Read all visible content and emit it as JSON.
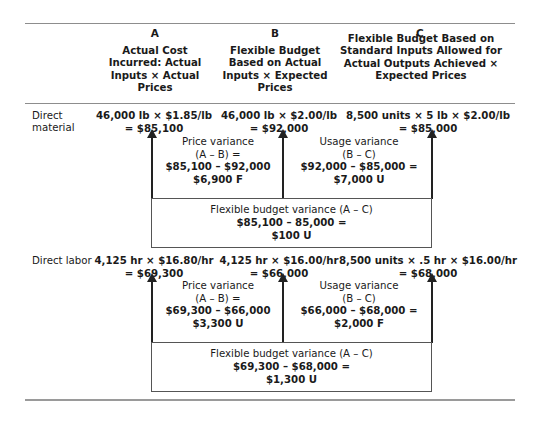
{
  "columns": {
    "a": {
      "letter": "A",
      "heading": "Actual Cost Incurred: Actual Inputs × Actual Prices"
    },
    "b": {
      "letter": "B",
      "heading": "Flexible Budget Based on Actual Inputs × Expected Prices"
    },
    "c": {
      "letter": "C",
      "heading": "Flexible Budget Based on Standard Inputs Allowed for Actual Outputs Achieved × Expected Prices"
    }
  },
  "rows": [
    {
      "label": "Direct material",
      "cells": {
        "a": {
          "line1": "46,000 lb × $1.85/lb",
          "line2": "= $85,100"
        },
        "b": {
          "line1": "46,000 lb × $2.00/lb",
          "line2": "= $92,000"
        },
        "c": {
          "line1": "8,500 units × 5 lb × $2.00/lb",
          "line2": "= $85,000"
        }
      },
      "price_variance": {
        "title": "Price variance",
        "formula": "(A – B) =",
        "calc": "$85,100 – $92,000",
        "result": "$6,900 F"
      },
      "usage_variance": {
        "title": "Usage variance",
        "formula": "(B – C)",
        "calc": "$92,000 – $85,000 =",
        "result": "$7,000 U"
      },
      "flexible_budget_variance": {
        "title": "Flexible budget variance (A – C)",
        "calc": "$85,100 – 85,000 =",
        "result": "$100 U"
      }
    },
    {
      "label": "Direct labor",
      "cells": {
        "a": {
          "line1": "4,125 hr × $16.80/hr",
          "line2": "= $69,300"
        },
        "b": {
          "line1": "4,125 hr × $16.00/hr",
          "line2": "= $66,000"
        },
        "c": {
          "line1": "8,500 units × .5 hr × $16.00/hr",
          "line2": "= $68,000"
        }
      },
      "price_variance": {
        "title": "Price variance",
        "formula": "(A – B) =",
        "calc": "$69,300 – $66,000",
        "result": "$3,300 U"
      },
      "usage_variance": {
        "title": "Usage variance",
        "formula": "(B – C)",
        "calc": "$66,000 – $68,000 =",
        "result": "$2,000 F"
      },
      "flexible_budget_variance": {
        "title": "Flexible budget variance (A – C)",
        "calc": "$69,300 – $68,000 =",
        "result": "$1,300 U"
      }
    }
  ]
}
